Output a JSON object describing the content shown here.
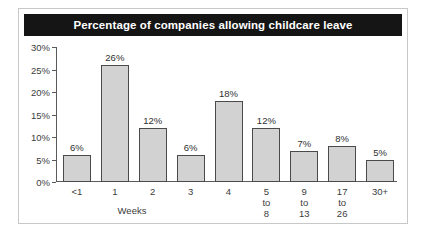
{
  "figure": {
    "title": "Percentage of companies allowing childcare leave",
    "background_color": "#ffffff",
    "frame_color": "#c8c8c8",
    "title_bar_color": "#151515",
    "title_text_color": "#ffffff"
  },
  "chart_data": {
    "type": "bar",
    "title": "Percentage of companies allowing childcare leave",
    "xlabel": "Weeks",
    "ylabel": "",
    "categories": [
      "<1",
      "1",
      "2",
      "3",
      "4",
      "5\nto\n8",
      "9\nto\n13",
      "17\nto\n26",
      "30+"
    ],
    "values": [
      6,
      26,
      12,
      6,
      18,
      12,
      7,
      8,
      5
    ],
    "data_labels": [
      "6%",
      "26%",
      "12%",
      "6%",
      "18%",
      "12%",
      "7%",
      "8%",
      "5%"
    ],
    "ylim": [
      0,
      30
    ],
    "ytick_values": [
      0,
      5,
      10,
      15,
      20,
      25,
      30
    ],
    "ytick_labels": [
      "0%",
      "5%",
      "10%",
      "15%",
      "20%",
      "25%",
      "30%"
    ],
    "grid": false,
    "legend": null,
    "bar_fill_color": "#d2d2d2",
    "bar_edge_color": "#4a4a4a"
  }
}
